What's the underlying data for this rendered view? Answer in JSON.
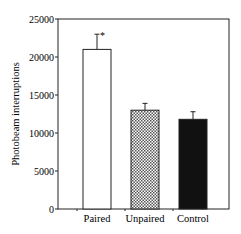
{
  "chart_data": {
    "type": "bar",
    "title": "",
    "xlabel": "",
    "ylabel": "Photobeam interruptions",
    "ylim": [
      0,
      25000
    ],
    "yticks": [
      0,
      5000,
      10000,
      15000,
      20000,
      25000
    ],
    "categories": [
      "Paired",
      "Unpaired",
      "Control"
    ],
    "values": [
      21000,
      13000,
      11800
    ],
    "errors": [
      2000,
      900,
      1000
    ],
    "fills": [
      "white",
      "crosshatch",
      "black"
    ],
    "annotations": [
      {
        "category": "Paired",
        "text": "*"
      }
    ],
    "grid": false,
    "legend": null
  }
}
